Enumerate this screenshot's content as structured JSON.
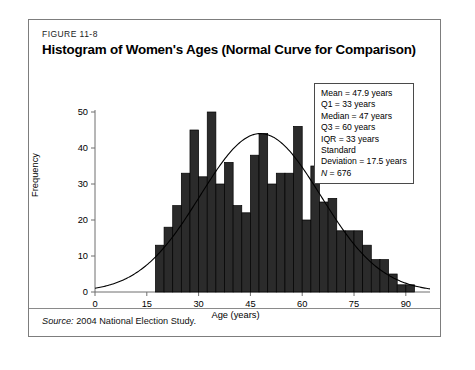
{
  "figure": {
    "number": "FIGURE 11-8",
    "title": "Histogram of Women's Ages (Normal Curve for Comparison)",
    "source_label": "Source:",
    "source_text": " 2004 National Election Study."
  },
  "stats_box": {
    "lines": [
      "Mean = 47.9 years",
      "Q1 = 33 years",
      "Median = 47 years",
      "Q3 = 60 years",
      "IQR = 33 years",
      "Standard",
      "Deviation = 17.5 years"
    ],
    "n_italic": "N",
    "n_value": " = 676"
  },
  "colors": {
    "bar_fill": "#2b2b2b",
    "bar_edge": "#000000",
    "curve": "#000000",
    "axis": "#6f6f6f",
    "card_border": "#7d7d7d"
  },
  "chart_data": {
    "type": "bar",
    "title": "Histogram of Women's Ages (Normal Curve for Comparison)",
    "xlabel": "Age (years)",
    "ylabel": "Frequency",
    "xlim": [
      0,
      97
    ],
    "ylim": [
      0,
      50
    ],
    "xticks": [
      0,
      15,
      30,
      45,
      60,
      75,
      90
    ],
    "yticks": [
      0,
      10,
      20,
      30,
      40,
      50
    ],
    "grid": false,
    "legend": "none",
    "bin_width": 2.5,
    "bin_starts": [
      17.5,
      20,
      22.5,
      25,
      27.5,
      30,
      32.5,
      35,
      37.5,
      40,
      42.5,
      45,
      47.5,
      50,
      52.5,
      55,
      57.5,
      60,
      62.5,
      65,
      67.5,
      70,
      72.5,
      75,
      77.5,
      80,
      82.5,
      85,
      87.5,
      90
    ],
    "values": [
      13,
      18,
      24,
      33,
      45,
      32,
      50,
      30,
      36,
      24,
      22,
      38,
      44,
      30,
      33,
      33,
      46,
      20,
      35,
      25,
      26,
      17,
      17,
      17,
      13,
      9,
      9,
      5,
      2,
      2
    ],
    "categories": [
      "17.5-20",
      "20-22.5",
      "22.5-25",
      "25-27.5",
      "27.5-30",
      "30-32.5",
      "32.5-35",
      "35-37.5",
      "37.5-40",
      "40-42.5",
      "42.5-45",
      "45-47.5",
      "47.5-50",
      "50-52.5",
      "52.5-55",
      "55-57.5",
      "57.5-60",
      "60-62.5",
      "62.5-65",
      "65-67.5",
      "67.5-70",
      "70-72.5",
      "72.5-75",
      "75-77.5",
      "77.5-80",
      "80-82.5",
      "82.5-85",
      "85-87.5",
      "87.5-90",
      "90-92.5"
    ],
    "overlay": {
      "type": "normal-curve",
      "mean": 47.9,
      "std": 17.5,
      "peak": 44,
      "label": "Normal Curve for Comparison"
    },
    "annotations": {
      "mean": 47.9,
      "q1": 33,
      "median": 47,
      "q3": 60,
      "iqr": 33,
      "standard_deviation": 17.5,
      "n": 676
    }
  }
}
